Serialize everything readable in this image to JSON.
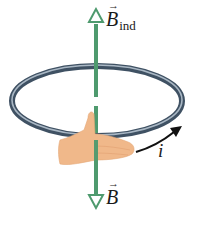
{
  "diagram": {
    "labels": {
      "induced_field": {
        "symbol": "B",
        "subscript": "ind",
        "vector_arrow": "→"
      },
      "external_field": {
        "symbol": "B",
        "vector_arrow": "→"
      },
      "current": {
        "symbol": "i"
      }
    },
    "elements": {
      "axis": {
        "direction": "vertical",
        "color": "#4e9a6e"
      },
      "induced_field_arrow": {
        "direction": "up",
        "style": "hollow-head",
        "color": "#4e9a6e"
      },
      "external_field_arrow": {
        "direction": "down",
        "style": "hollow-head",
        "color": "#4e9a6e"
      },
      "loop": {
        "shape": "ellipse",
        "color": "#5d6f80",
        "highlight": "#a9b7c4"
      },
      "hand": {
        "rule": "right-hand",
        "thumb_direction": "up",
        "fingers_curl": "counterclockwise-viewed-from-top",
        "color": "#f0b88a"
      },
      "current_arrow": {
        "color": "#111111"
      }
    }
  }
}
